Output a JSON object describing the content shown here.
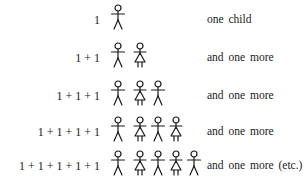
{
  "rows": [
    {
      "expression": "1",
      "figures": [
        "boy"
      ],
      "description": "one child",
      "top": 4
    },
    {
      "expression": "1 + 1",
      "figures": [
        "boy",
        "girl"
      ],
      "description": "and one more",
      "top": 42
    },
    {
      "expression": "1 + 1 + 1",
      "figures": [
        "boy",
        "girl",
        "boy"
      ],
      "description": "and one more",
      "top": 80
    },
    {
      "expression": "1 + 1 + 1 + 1",
      "figures": [
        "boy",
        "girl",
        "boy",
        "girl"
      ],
      "description": "and one more",
      "top": 116
    },
    {
      "expression": "1 + 1 + 1 + 1 + 1",
      "figures": [
        "boy",
        "girl",
        "boy",
        "girl",
        "boy"
      ],
      "description": "and one more (etc.)",
      "top": 150
    }
  ],
  "colors": {
    "ink": "#1a1a1a",
    "background": "#ffffff"
  }
}
